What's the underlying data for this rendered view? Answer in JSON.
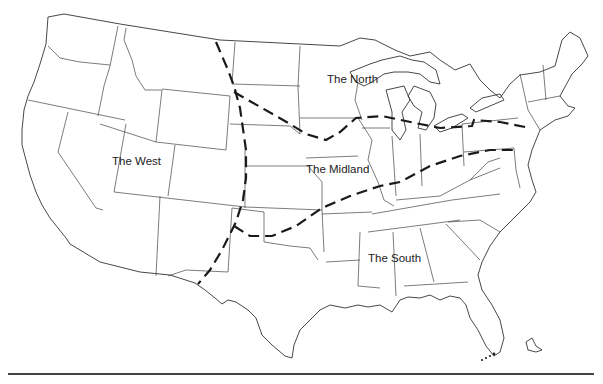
{
  "map": {
    "title": "US dialect regions",
    "regions": [
      {
        "id": "north",
        "label": "The North",
        "x": 327,
        "y": 73
      },
      {
        "id": "west",
        "label": "The West",
        "x": 112,
        "y": 155
      },
      {
        "id": "midland",
        "label": "The Midland",
        "x": 306,
        "y": 163
      },
      {
        "id": "south",
        "label": "The South",
        "x": 368,
        "y": 252
      }
    ],
    "colors": {
      "background": "#ffffff",
      "outline": "#333333",
      "dialect_boundary": "#1a1a1a"
    }
  }
}
